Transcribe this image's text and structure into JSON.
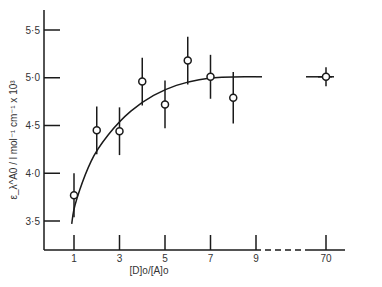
{
  "chart_data": {
    "type": "scatter",
    "title": "",
    "xlabel": "[D]o/[A]o",
    "ylabel": "ε_λ^A0 / l mol⁻¹ cm⁻¹ x 10³",
    "x_ticks": [
      "1",
      "3",
      "5",
      "7",
      "9",
      "70"
    ],
    "y_ticks": [
      "3·5",
      "4·0",
      "4·5",
      "5·0",
      "5·5"
    ],
    "ylim": [
      3.2,
      5.7
    ],
    "axis_break": {
      "from": 9,
      "to": 70,
      "style": "dashed"
    },
    "grid": false,
    "legend": null,
    "series": [
      {
        "name": "measured",
        "marker": "open-circle",
        "x": [
          1,
          2,
          3,
          4,
          5,
          6,
          7,
          8,
          70
        ],
        "y": [
          3.77,
          4.45,
          4.44,
          4.96,
          4.72,
          5.18,
          5.01,
          4.79,
          5.01
        ],
        "error": [
          0.23,
          0.25,
          0.25,
          0.25,
          0.25,
          0.25,
          0.23,
          0.27,
          0.1
        ]
      },
      {
        "name": "fit",
        "style": "solid-curve",
        "x": [
          0.9,
          1,
          1.5,
          2,
          3,
          4,
          5,
          6,
          7,
          8,
          9,
          70,
          72
        ],
        "y": [
          3.47,
          3.65,
          4.0,
          4.25,
          4.55,
          4.75,
          4.88,
          4.96,
          5.0,
          5.01,
          5.01,
          5.01,
          5.01
        ]
      }
    ]
  }
}
